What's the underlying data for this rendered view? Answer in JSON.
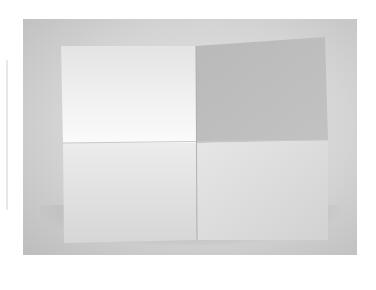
{
  "image": {
    "subject": "folded-sheet-of-paper",
    "background_color": "#ffffff",
    "backdrop_color": "#d2d2d2",
    "panels": [
      {
        "name": "top-left",
        "color": "#f0f0f0"
      },
      {
        "name": "top-right",
        "color": "#bdbdbd"
      },
      {
        "name": "bottom-left",
        "color": "#e0e0e0"
      },
      {
        "name": "bottom-right",
        "color": "#dcdcdc"
      }
    ]
  }
}
